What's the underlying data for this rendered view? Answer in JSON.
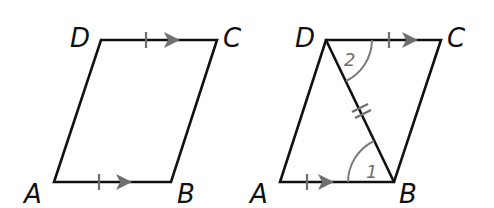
{
  "figures": [
    {
      "name": "parallelogram-abcd",
      "vertices": {
        "A": {
          "label": "A",
          "x": 54,
          "y": 182
        },
        "B": {
          "label": "B",
          "x": 171,
          "y": 182
        },
        "C": {
          "label": "C",
          "x": 217,
          "y": 40
        },
        "D": {
          "label": "D",
          "x": 101,
          "y": 40
        }
      },
      "markings": [
        "DC single tick + parallel arrow",
        "AB single tick + parallel arrow"
      ]
    },
    {
      "name": "parallelogram-abcd-with-diagonal",
      "vertices": {
        "A": {
          "label": "A",
          "x": 280,
          "y": 182
        },
        "B": {
          "label": "B",
          "x": 394,
          "y": 182
        },
        "C": {
          "label": "C",
          "x": 441,
          "y": 40
        },
        "D": {
          "label": "D",
          "x": 326,
          "y": 40
        }
      },
      "diagonal": "DB",
      "angles": {
        "angle1": {
          "label": "1",
          "at": "B"
        },
        "angle2": {
          "label": "2",
          "at": "D"
        }
      },
      "markings": [
        "DC single tick + parallel arrow",
        "AB single tick + parallel arrow",
        "DB double tick"
      ]
    }
  ],
  "colors": {
    "edge": "#111111",
    "mark": "#6f6f6f",
    "background": "#ffffff"
  }
}
